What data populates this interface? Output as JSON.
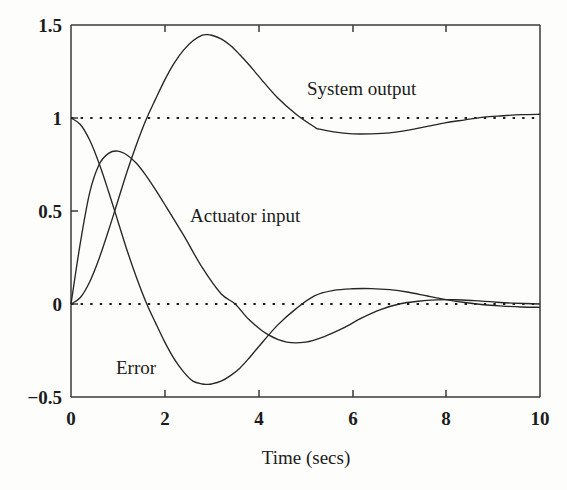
{
  "chart_data": {
    "type": "line",
    "title": "",
    "xlabel": "Time (secs)",
    "ylabel": "",
    "xlim": [
      0,
      10
    ],
    "ylim": [
      -0.5,
      1.5
    ],
    "xticks": [
      "0",
      "2",
      "4",
      "6",
      "8",
      "10"
    ],
    "xtick_values": [
      0,
      2,
      4,
      6,
      8,
      10
    ],
    "yticks": [
      "1.5",
      "1",
      "0.5",
      "0",
      "-0.5"
    ],
    "ytick_values": [
      1.5,
      1.0,
      0.5,
      0.0,
      -0.5
    ],
    "grid": false,
    "legend_position": "inline-annotations",
    "reference_lines": [
      {
        "axis": "y",
        "value": 1,
        "style": "dotted"
      },
      {
        "axis": "y",
        "value": 0,
        "style": "dotted"
      }
    ],
    "annotations": [
      {
        "text": "System output",
        "x": 6.3,
        "y": 1.22
      },
      {
        "text": "Actuator input",
        "x": 3.5,
        "y": 0.57
      },
      {
        "text": "Error",
        "x": 1.6,
        "y": -0.29
      }
    ],
    "series": [
      {
        "name": "System output",
        "x": [
          0,
          0.2,
          0.4,
          0.6,
          0.8,
          1.0,
          1.2,
          1.4,
          1.6,
          1.8,
          2.0,
          2.2,
          2.4,
          2.6,
          2.8,
          2.9,
          3.0,
          3.2,
          3.4,
          3.6,
          3.8,
          4.0,
          4.4,
          4.8,
          5.2,
          5.3,
          5.6,
          6.0,
          6.4,
          6.8,
          7.2,
          7.6,
          8.0,
          8.4,
          8.8,
          9.2,
          9.6,
          10.0
        ],
        "y": [
          0.0,
          0.035,
          0.12,
          0.245,
          0.395,
          0.555,
          0.715,
          0.86,
          0.99,
          1.1,
          1.205,
          1.295,
          1.365,
          1.415,
          1.445,
          1.448,
          1.445,
          1.425,
          1.39,
          1.34,
          1.285,
          1.225,
          1.11,
          1.02,
          0.95,
          0.94,
          0.925,
          0.915,
          0.915,
          0.92,
          0.935,
          0.955,
          0.975,
          0.99,
          1.005,
          1.012,
          1.018,
          1.02
        ]
      },
      {
        "name": "Error",
        "x": [
          0,
          0.2,
          0.4,
          0.6,
          0.8,
          1.0,
          1.2,
          1.4,
          1.6,
          1.8,
          2.0,
          2.2,
          2.4,
          2.6,
          2.8,
          2.9,
          3.0,
          3.2,
          3.4,
          3.6,
          3.8,
          4.0,
          4.4,
          4.8,
          5.2,
          5.6,
          6.0,
          6.4,
          6.8,
          7.2,
          7.6,
          8.0,
          8.4,
          8.8,
          9.2,
          9.6,
          10.0
        ],
        "y": [
          1.0,
          0.965,
          0.88,
          0.755,
          0.605,
          0.445,
          0.285,
          0.14,
          0.01,
          -0.1,
          -0.205,
          -0.295,
          -0.365,
          -0.415,
          -0.43,
          -0.432,
          -0.43,
          -0.415,
          -0.385,
          -0.345,
          -0.29,
          -0.23,
          -0.115,
          -0.025,
          0.045,
          0.073,
          0.082,
          0.083,
          0.077,
          0.063,
          0.043,
          0.024,
          0.008,
          -0.004,
          -0.011,
          -0.016,
          -0.018
        ]
      },
      {
        "name": "Actuator input",
        "x": [
          0,
          0.2,
          0.4,
          0.6,
          0.8,
          1.0,
          1.2,
          1.4,
          1.6,
          1.8,
          2.0,
          2.4,
          2.8,
          3.2,
          3.5,
          3.8,
          4.2,
          4.6,
          5.0,
          5.4,
          5.8,
          6.2,
          6.6,
          7.0,
          7.4,
          7.8,
          8.2,
          8.6,
          9.0,
          9.4,
          10.0
        ],
        "y": [
          0.0,
          0.33,
          0.6,
          0.75,
          0.81,
          0.822,
          0.8,
          0.755,
          0.69,
          0.615,
          0.535,
          0.37,
          0.195,
          0.055,
          0.0,
          -0.085,
          -0.165,
          -0.205,
          -0.205,
          -0.175,
          -0.13,
          -0.075,
          -0.03,
          0.0,
          0.015,
          0.022,
          0.023,
          0.018,
          0.011,
          0.005,
          0.0
        ]
      }
    ]
  },
  "labels": {
    "system_output": "System output",
    "actuator_input": "Actuator input",
    "error": "Error",
    "xaxis_title": "Time (secs)",
    "ytick_1_5": "1.5",
    "ytick_1": "1",
    "ytick_0_5": "0.5",
    "ytick_0": "0",
    "ytick_neg_0_5": "−0.5",
    "xtick_0": "0",
    "xtick_2": "2",
    "xtick_4": "4",
    "xtick_6": "6",
    "xtick_8": "8",
    "xtick_10": "10"
  },
  "colors": {
    "curve": "#262626",
    "axis": "#3a3a3a",
    "text": "#1b1b1b",
    "background": "#fdfdfc"
  }
}
